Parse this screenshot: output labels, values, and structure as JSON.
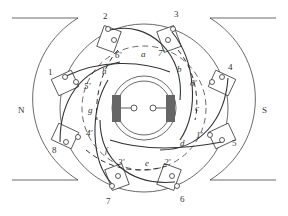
{
  "diagram": {
    "poles": {
      "north": "N",
      "south": "S"
    },
    "slot_numbers": [
      "1",
      "2",
      "3",
      "4",
      "5",
      "6",
      "7",
      "8"
    ],
    "primed_labels": [
      "1'",
      "2'",
      "3'",
      "4'",
      "5'",
      "6'",
      "7'",
      "8'"
    ],
    "coil_labels": [
      "a",
      "b",
      "c",
      "d",
      "e",
      "f",
      "g",
      "h"
    ],
    "colors": {
      "line": "#333333",
      "brush": "#666666",
      "background": "#ffffff"
    }
  }
}
